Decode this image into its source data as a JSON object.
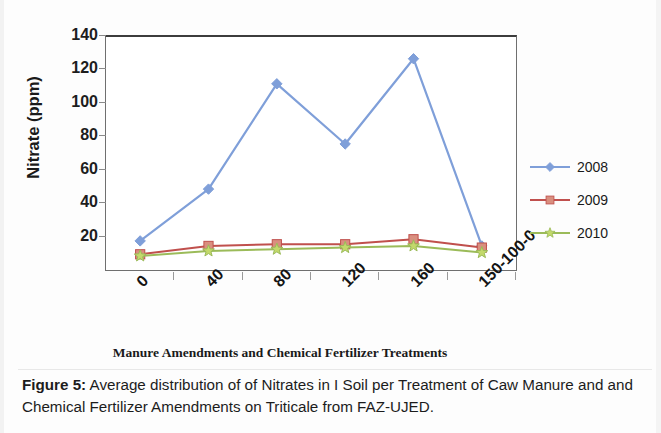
{
  "chart_data": {
    "type": "line",
    "title": "",
    "xlabel": "Manure Amendments and Chemical Fertilizer Treatments",
    "ylabel": "Nitrate (ppm)",
    "categories": [
      "0",
      "40",
      "80",
      "120",
      "160",
      "150-100-0"
    ],
    "ylim": [
      0,
      140
    ],
    "yticks": [
      0,
      20,
      40,
      60,
      80,
      100,
      120,
      140
    ],
    "ytick_labels": [
      "20",
      "40",
      "60",
      "80",
      "100",
      "120",
      "140"
    ],
    "grid": false,
    "legend_position": "right",
    "series": [
      {
        "name": "2008",
        "color": "#7f9fd9",
        "marker": "diamond",
        "values": [
          18,
          49,
          112,
          76,
          127,
          15
        ]
      },
      {
        "name": "2009",
        "color": "#c0504d",
        "marker": "square",
        "marker_fill": "#d98f7f",
        "values": [
          10,
          15,
          16,
          16,
          19,
          14
        ]
      },
      {
        "name": "2010",
        "color": "#9bbb59",
        "marker": "star",
        "marker_fill": "#c3d96b",
        "values": [
          9,
          12,
          13,
          14,
          15,
          11
        ]
      }
    ]
  },
  "axes": {
    "y_title": "Nitrate (ppm)",
    "x_title": "Manure Amendments and Chemical Fertilizer Treatments",
    "y_tick_labels": [
      "140",
      "120",
      "100",
      "80",
      "60",
      "40",
      "20"
    ],
    "x_tick_labels": [
      "0",
      "40",
      "80",
      "120",
      "160",
      "150-100-0"
    ]
  },
  "legend": {
    "items": [
      {
        "label": "2008",
        "color": "#7f9fd9",
        "marker": "diamond"
      },
      {
        "label": "2009",
        "color": "#c0504d",
        "marker": "square"
      },
      {
        "label": "2010",
        "color": "#9bbb59",
        "marker": "star"
      }
    ]
  },
  "caption": {
    "figure_number": "Figure  5:",
    "text": " Average distribution of of Nitrates in I Soil per  Treatment of Caw Manure and  and Chemical Fertilizer Amendments on Triticale from FAZ-UJED."
  },
  "colors": {
    "series_2008": "#7f9fd9",
    "series_2009": "#c0504d",
    "series_2010": "#9bbb59",
    "axis": "#6f6f6f",
    "text": "#1a1a1a"
  }
}
